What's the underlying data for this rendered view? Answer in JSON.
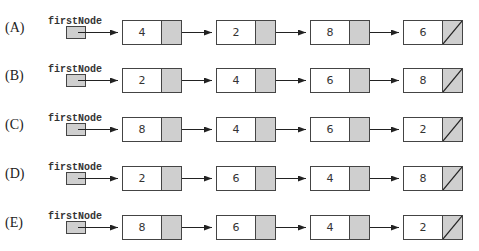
{
  "diagram": {
    "type": "linked-list-options",
    "head_label": "firstNode",
    "colors": {
      "next_cell": "#cfcfcf",
      "border": "#444444",
      "arrow": "#222222"
    },
    "options": [
      {
        "label": "(A)",
        "values": [
          "4",
          "2",
          "8",
          "6"
        ]
      },
      {
        "label": "(B)",
        "values": [
          "2",
          "4",
          "6",
          "8"
        ]
      },
      {
        "label": "(C)",
        "values": [
          "8",
          "4",
          "6",
          "2"
        ]
      },
      {
        "label": "(D)",
        "values": [
          "2",
          "6",
          "4",
          "8"
        ]
      },
      {
        "label": "(E)",
        "values": [
          "8",
          "6",
          "4",
          "2"
        ]
      }
    ],
    "last_node_next": "null (slash)"
  }
}
